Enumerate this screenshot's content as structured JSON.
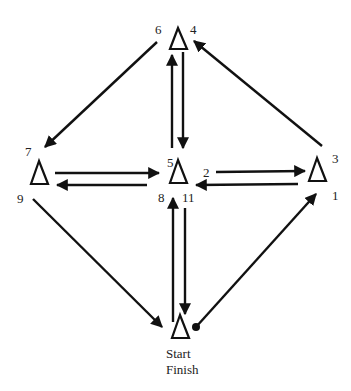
{
  "diagram": {
    "type": "route-diagram",
    "colors": {
      "ink": "#111111",
      "background": "#ffffff"
    },
    "nodes": [
      {
        "id": "top",
        "labels": [
          "6",
          "4"
        ]
      },
      {
        "id": "left",
        "labels": [
          "7",
          "9"
        ]
      },
      {
        "id": "center",
        "labels": [
          "5",
          "2",
          "8",
          "11"
        ]
      },
      {
        "id": "right",
        "labels": [
          "3",
          "1"
        ]
      },
      {
        "id": "bottom",
        "labels": [],
        "caption": [
          "Start",
          "Finish"
        ],
        "marker": "start-dot"
      }
    ],
    "edges": [
      {
        "from": "bottom",
        "to": "right",
        "style": "dot-to-arrow"
      },
      {
        "from": "right",
        "to": "center"
      },
      {
        "from": "center",
        "to": "right"
      },
      {
        "from": "right",
        "to": "top"
      },
      {
        "from": "center",
        "to": "top"
      },
      {
        "from": "top",
        "to": "center"
      },
      {
        "from": "top",
        "to": "left"
      },
      {
        "from": "left",
        "to": "center"
      },
      {
        "from": "center",
        "to": "left"
      },
      {
        "from": "left",
        "to": "bottom"
      },
      {
        "from": "bottom",
        "to": "center"
      },
      {
        "from": "center",
        "to": "bottom"
      }
    ],
    "labels": {
      "l1": "1",
      "l2": "2",
      "l3": "3",
      "l4": "4",
      "l5": "5",
      "l6": "6",
      "l7": "7",
      "l8": "8",
      "l9": "9",
      "l11": "11",
      "start": "Start",
      "finish": "Finish"
    }
  }
}
